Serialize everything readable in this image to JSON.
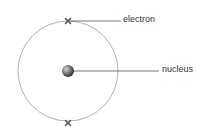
{
  "diagram": {
    "labels": {
      "electron": "electron",
      "nucleus": "nucleus"
    },
    "colors": {
      "orbit": "#9a9a9a",
      "leader": "#555555",
      "electron": "#555555",
      "nucleus_light": "#bbbbbb",
      "nucleus_dark": "#333333",
      "text": "#333333"
    },
    "elements": {
      "orbit_count": 1,
      "electron_count": 2,
      "nucleus_count": 1
    }
  }
}
